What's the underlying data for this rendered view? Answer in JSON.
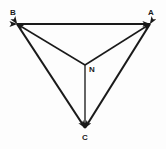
{
  "diagram": {
    "type": "directed-graph",
    "title": "",
    "background_color": "#fdfdfd",
    "stroke_color": "#1a1a1a",
    "nodes": [
      {
        "id": "B",
        "label": "B",
        "x": 17,
        "y": 24,
        "label_x": 10,
        "label_y": 9
      },
      {
        "id": "A",
        "label": "A",
        "x": 150,
        "y": 24,
        "label_x": 148,
        "label_y": 9
      },
      {
        "id": "N",
        "label": "N",
        "x": 85,
        "y": 65,
        "label_x": 89,
        "label_y": 66
      },
      {
        "id": "C",
        "label": "C",
        "x": 85,
        "y": 128,
        "label_x": 82,
        "label_y": 134
      }
    ],
    "edges": [
      {
        "id": "edge-b-a",
        "from": "B",
        "to": "A",
        "arrows": "both",
        "weight": "thick"
      },
      {
        "id": "edge-b-c",
        "from": "B",
        "to": "C",
        "arrows": "both",
        "weight": "thick"
      },
      {
        "id": "edge-a-c",
        "from": "A",
        "to": "C",
        "arrows": "both",
        "weight": "thick"
      },
      {
        "id": "edge-n-b",
        "from": "N",
        "to": "B",
        "arrows": "forward",
        "weight": "thin"
      },
      {
        "id": "edge-n-a",
        "from": "N",
        "to": "A",
        "arrows": "forward",
        "weight": "thin"
      },
      {
        "id": "edge-n-c",
        "from": "N",
        "to": "C",
        "arrows": "forward",
        "weight": "thin"
      }
    ]
  }
}
